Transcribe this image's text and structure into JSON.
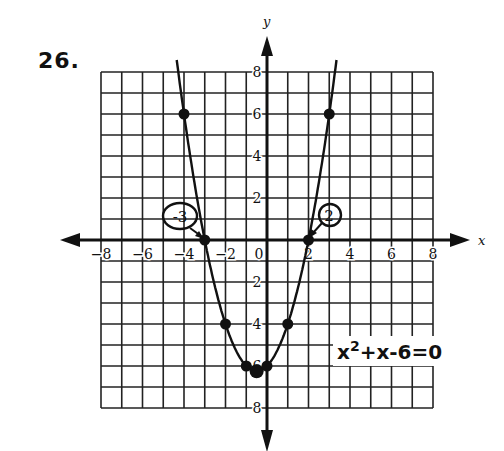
{
  "problem": {
    "number": "26."
  },
  "equation": {
    "base": "x",
    "exp": "2",
    "rest": "+x-6=0"
  },
  "axes": {
    "x_label": "x",
    "y_label": "y"
  },
  "annotations": {
    "left_root": "-3",
    "right_root": "2"
  },
  "colors": {
    "ink": "#111111",
    "grid": "#222222",
    "paper": "#ffffff"
  },
  "chart_data": {
    "type": "line",
    "xlabel": "x",
    "ylabel": "y",
    "xlim": [
      -8,
      8
    ],
    "ylim": [
      -8,
      8
    ],
    "grid": true,
    "x_ticks": [
      -8,
      -6,
      -4,
      -2,
      0,
      2,
      4,
      6,
      8
    ],
    "y_ticks": [
      8,
      6,
      4,
      2,
      -2,
      -4,
      -6,
      -8
    ],
    "series": [
      {
        "name": "y = x^2 + x - 6",
        "points": [
          [
            -4,
            6
          ],
          [
            -3,
            0
          ],
          [
            -2,
            -4
          ],
          [
            -1,
            -6
          ],
          [
            -0.5,
            -6.25
          ],
          [
            0,
            -6
          ],
          [
            1,
            -4
          ],
          [
            2,
            0
          ],
          [
            3,
            6
          ]
        ]
      }
    ],
    "annotations": [
      {
        "text": "-3",
        "x": -3,
        "y": 0,
        "note": "circled root"
      },
      {
        "text": "2",
        "x": 2,
        "y": 0,
        "note": "circled root"
      }
    ]
  }
}
